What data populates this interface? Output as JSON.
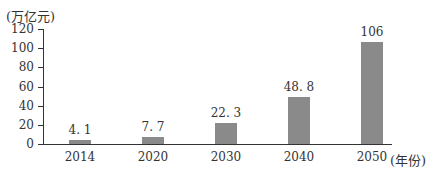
{
  "chart_data": {
    "type": "bar",
    "title": "",
    "ylabel": "(万亿元)",
    "xlabel": "(年份)",
    "categories": [
      "2014",
      "2020",
      "2030",
      "2040",
      "2050"
    ],
    "values": [
      4.1,
      7.7,
      22.3,
      48.8,
      106
    ],
    "value_labels": [
      "4. 1",
      "7. 7",
      "22. 3",
      "48. 8",
      "106"
    ],
    "ylim": [
      0,
      120
    ],
    "yticks": [
      0,
      20,
      40,
      60,
      80,
      100,
      120
    ],
    "ytick_labels": [
      "0",
      "20",
      "40",
      "60",
      "80",
      "100",
      "120"
    ],
    "grid": false,
    "legend": null,
    "bar_color": "#8a8a8a"
  },
  "labels": {
    "unit": "(万亿元)",
    "x_axis_unit": "(年份)"
  }
}
